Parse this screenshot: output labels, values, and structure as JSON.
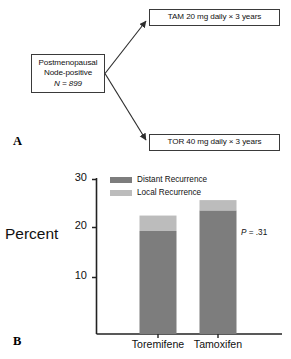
{
  "figure": {
    "panel_a": {
      "letter": "A",
      "boxes": [
        {
          "id": "source",
          "lines": [
            "Postmenopausal",
            "Node-positive"
          ],
          "italic_line": "N = 899"
        },
        {
          "id": "tam",
          "lines": [
            "TAM 20 mg daily × 3 years"
          ]
        },
        {
          "id": "tor",
          "lines": [
            "TOR 40 mg daily × 3 years"
          ]
        }
      ]
    },
    "panel_b": {
      "letter": "B"
    }
  },
  "chart_data": {
    "type": "bar",
    "subtype": "stacked",
    "title": "",
    "xlabel": "",
    "ylabel": "Percent",
    "ylim": [
      0,
      30
    ],
    "yticks": [
      10,
      20,
      30
    ],
    "ytick_labels": [
      "10",
      "20",
      "30"
    ],
    "grid": false,
    "legend_position": "top-left-inside",
    "categories": [
      "Toremifene",
      "Tamoxifen"
    ],
    "series": [
      {
        "name": "Distant Recurrence",
        "color": "#7d7d7d",
        "values": [
          20,
          24
        ]
      },
      {
        "name": "Local Recurrence",
        "color": "#bcbcbc",
        "values": [
          3,
          2
        ]
      }
    ],
    "totals": [
      23,
      26
    ],
    "annotations": [
      {
        "name": "p-value",
        "p_label": "P",
        "text": " = .31"
      }
    ]
  },
  "colors": {
    "distant_recurrence": "#7d7d7d",
    "local_recurrence": "#bcbcbc",
    "axis": "#222222",
    "box_border": "#3a3a3a"
  }
}
